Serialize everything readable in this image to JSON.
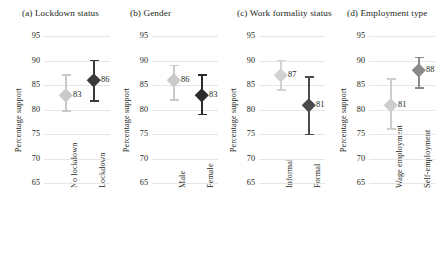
{
  "chart_data": {
    "type": "scatter",
    "title": "",
    "ylabel": "Percentage support",
    "xlabel": "",
    "ylim": [
      65,
      95
    ],
    "yticks": [
      95,
      90,
      85,
      80,
      75,
      70,
      65
    ],
    "grid": true,
    "legend": false,
    "error_bars": "confidence interval",
    "panels": [
      {
        "title": "(a) Lockdown status",
        "categories": [
          "No lockdown",
          "Lockdown"
        ],
        "values": [
          83,
          86
        ],
        "labels": [
          "83",
          "86"
        ],
        "ci_low": [
          79.7,
          81.7
        ],
        "ci_high": [
          87.0,
          90.0
        ],
        "colors": [
          "#c9c9c9",
          "#3a3a3a"
        ]
      },
      {
        "title": "(b) Gender",
        "categories": [
          "Male",
          "Female"
        ],
        "values": [
          86,
          83
        ],
        "labels": [
          "86",
          "83"
        ],
        "ci_low": [
          82.0,
          79.0
        ],
        "ci_high": [
          89.0,
          87.0
        ],
        "colors": [
          "#c9c9c9",
          "#2b2b2b"
        ]
      },
      {
        "title": "(c) Work formality status",
        "categories": [
          "Informal",
          "Formal"
        ],
        "values": [
          87,
          81
        ],
        "labels": [
          "87",
          "81"
        ],
        "ci_low": [
          84.0,
          74.9
        ],
        "ci_high": [
          90.0,
          86.6
        ],
        "colors": [
          "#d2d2d2",
          "#4a4a4a"
        ]
      },
      {
        "title": "(d) Employment type",
        "categories": [
          "Wage employment",
          "Self-employment"
        ],
        "values": [
          81,
          88
        ],
        "labels": [
          "81",
          "88"
        ],
        "ci_low": [
          76.1,
          84.4
        ],
        "ci_high": [
          86.2,
          90.6
        ],
        "colors": [
          "#cdcdcd",
          "#8a8a8a"
        ]
      }
    ]
  }
}
